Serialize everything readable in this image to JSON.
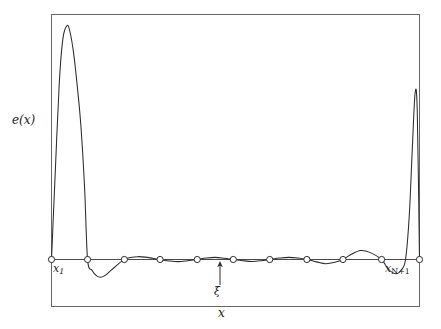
{
  "figure": {
    "background_color": "#ffffff",
    "line_color": "#2b2b2b",
    "frame_color": "#555555"
  },
  "labels": {
    "ylabel_e": "e",
    "ylabel_paren_open": "(",
    "ylabel_x": "x",
    "ylabel_paren_close": ")",
    "xlabel": "x",
    "first_node_base": "x",
    "first_node_sub": "1",
    "last_node_base": "x",
    "last_node_sub": "N+1",
    "xi_label": "ξ"
  },
  "chart_data": {
    "type": "line",
    "title": "",
    "xlabel": "x",
    "ylabel": "e(x)",
    "grid": false,
    "legend": null,
    "xlim": [
      0,
      1
    ],
    "ylim": [
      -0.12,
      1.0
    ],
    "baseline": 0,
    "annotations": [
      {
        "text": "x_1",
        "x": 0.0,
        "y": 0.0,
        "position": "below-right"
      },
      {
        "text": "x_N+1",
        "x": 1.0,
        "y": 0.0,
        "position": "below-left"
      },
      {
        "text": "ξ",
        "x": 0.487,
        "y": -0.085,
        "position": "below",
        "arrow_to": [
          0.487,
          0.0
        ]
      }
    ],
    "markers": {
      "shape": "circle-open",
      "label": "equioscillation nodes",
      "x": [
        0.0,
        0.098,
        0.198,
        0.295,
        0.396,
        0.494,
        0.593,
        0.694,
        0.792,
        0.897,
        1.0
      ],
      "y": [
        0,
        0,
        0,
        0,
        0,
        0,
        0,
        0,
        0,
        0,
        0
      ]
    },
    "series": [
      {
        "name": "e(x)",
        "x": [
          0.0,
          0.01,
          0.021,
          0.031,
          0.042,
          0.05,
          0.06,
          0.07,
          0.08,
          0.09,
          0.098,
          0.11,
          0.122,
          0.133,
          0.145,
          0.16,
          0.175,
          0.19,
          0.198,
          0.215,
          0.235,
          0.255,
          0.275,
          0.295,
          0.32,
          0.345,
          0.37,
          0.396,
          0.42,
          0.445,
          0.47,
          0.494,
          0.52,
          0.545,
          0.57,
          0.593,
          0.62,
          0.645,
          0.67,
          0.694,
          0.72,
          0.745,
          0.77,
          0.792,
          0.815,
          0.84,
          0.865,
          0.897,
          0.915,
          0.935,
          0.95,
          0.962,
          0.972,
          0.98,
          0.988,
          0.994,
          1.0
        ],
        "y": [
          0.0,
          0.36,
          0.74,
          0.93,
          0.985,
          0.96,
          0.87,
          0.73,
          0.56,
          0.3,
          0.0,
          -0.045,
          -0.068,
          -0.075,
          -0.068,
          -0.048,
          -0.028,
          -0.008,
          0.0,
          0.008,
          0.012,
          0.01,
          0.005,
          0.0,
          -0.006,
          -0.009,
          -0.005,
          0.0,
          0.006,
          0.009,
          0.005,
          0.0,
          -0.005,
          -0.008,
          -0.005,
          0.0,
          0.006,
          0.009,
          0.006,
          0.0,
          -0.01,
          -0.018,
          -0.012,
          0.0,
          0.022,
          0.038,
          0.03,
          0.0,
          -0.04,
          -0.06,
          -0.045,
          0.0,
          0.18,
          0.45,
          0.7,
          0.62,
          0.0
        ]
      }
    ]
  }
}
